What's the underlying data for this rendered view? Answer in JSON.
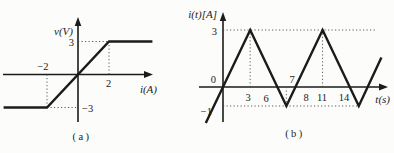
{
  "figure": {
    "background": "#fcfcfb",
    "line_color": "#1b1b1b"
  },
  "panel_a": {
    "caption": "(a)",
    "ylabel": "v(V)",
    "xlabel": "i(A)",
    "ticks": {
      "y_pos": "3",
      "y_neg": "−3",
      "x_neg": "−2",
      "x_pos": "2"
    }
  },
  "panel_b": {
    "caption": "(b)",
    "ylabel": "i(t)[A]",
    "xlabel": "t(s)",
    "ticks": {
      "y_pos": "3",
      "origin": "0",
      "y_neg": "−1",
      "t3": "3",
      "t6": "6",
      "t7": "7",
      "t8": "8",
      "t11": "11",
      "t14": "14"
    }
  },
  "chart_data": [
    {
      "id": "a",
      "type": "line",
      "title": "(a)",
      "xlabel": "i(A)",
      "ylabel": "v(V)",
      "series": [
        {
          "name": "v-i saturation characteristic",
          "points": [
            [
              -4.8,
              -3
            ],
            [
              -2,
              -3
            ],
            [
              2,
              3
            ],
            [
              4.8,
              3
            ]
          ]
        }
      ],
      "xticks": [
        -2,
        2
      ],
      "yticks": [
        -3,
        3
      ],
      "xlim": [
        -4.8,
        4.8
      ],
      "ylim": [
        -4.4,
        5.2
      ],
      "grid": false,
      "legend": false,
      "annotations": [
        "v = -3 V for i <= -2 A",
        "v = 1.5·i for -2 <= i <= 2",
        "v = 3 V for i >= 2 A"
      ],
      "guides": [
        {
          "type": "h",
          "y": 3,
          "from": 0,
          "to": 2
        },
        {
          "type": "v",
          "x": 2,
          "from": 3,
          "to": 0
        },
        {
          "type": "v",
          "x": -2,
          "from": 0,
          "to": -3
        },
        {
          "type": "h",
          "y": -3,
          "from": -2,
          "to": 0
        }
      ],
      "render": {
        "origin": [
          78,
          74.5
        ],
        "scale": [
          15.5,
          11
        ]
      }
    },
    {
      "id": "b",
      "type": "line",
      "title": "(b)",
      "xlabel": "t(s)",
      "ylabel": "i(t)[A]",
      "series": [
        {
          "name": "i(t) triangular wave",
          "points": [
            [
              -1.9,
              -1.9
            ],
            [
              3,
              3
            ],
            [
              7,
              -1
            ],
            [
              11,
              3
            ],
            [
              15,
              -1
            ],
            [
              17.5,
              1.55
            ]
          ]
        }
      ],
      "xticks": [
        0,
        3,
        6,
        7,
        8,
        11,
        14
      ],
      "yticks": [
        -1,
        0,
        3
      ],
      "xlim": [
        -2.6,
        18.2
      ],
      "ylim": [
        -1.9,
        4.0
      ],
      "grid": false,
      "legend": false,
      "annotations": [
        "triangular wave, slope ±1 A/s",
        "peaks i=3 A at t=3,11 s; minima i=-1 A at t=7,15 s",
        "zero crossings at t=0,6,8,14 s; period 8 s"
      ],
      "guides": [
        {
          "type": "h",
          "y": 3,
          "from": 0,
          "to": 16.9
        },
        {
          "type": "h",
          "y": -1,
          "from": 0,
          "to": 15
        },
        {
          "type": "v",
          "x": 3,
          "from": 0,
          "to": 3
        },
        {
          "type": "v",
          "x": 7,
          "from": 0,
          "to": -1
        },
        {
          "type": "v",
          "x": 11,
          "from": 0,
          "to": 3
        }
      ],
      "render": {
        "origin": [
          223,
          87
        ],
        "scale": [
          9.05,
          19
        ]
      }
    }
  ]
}
